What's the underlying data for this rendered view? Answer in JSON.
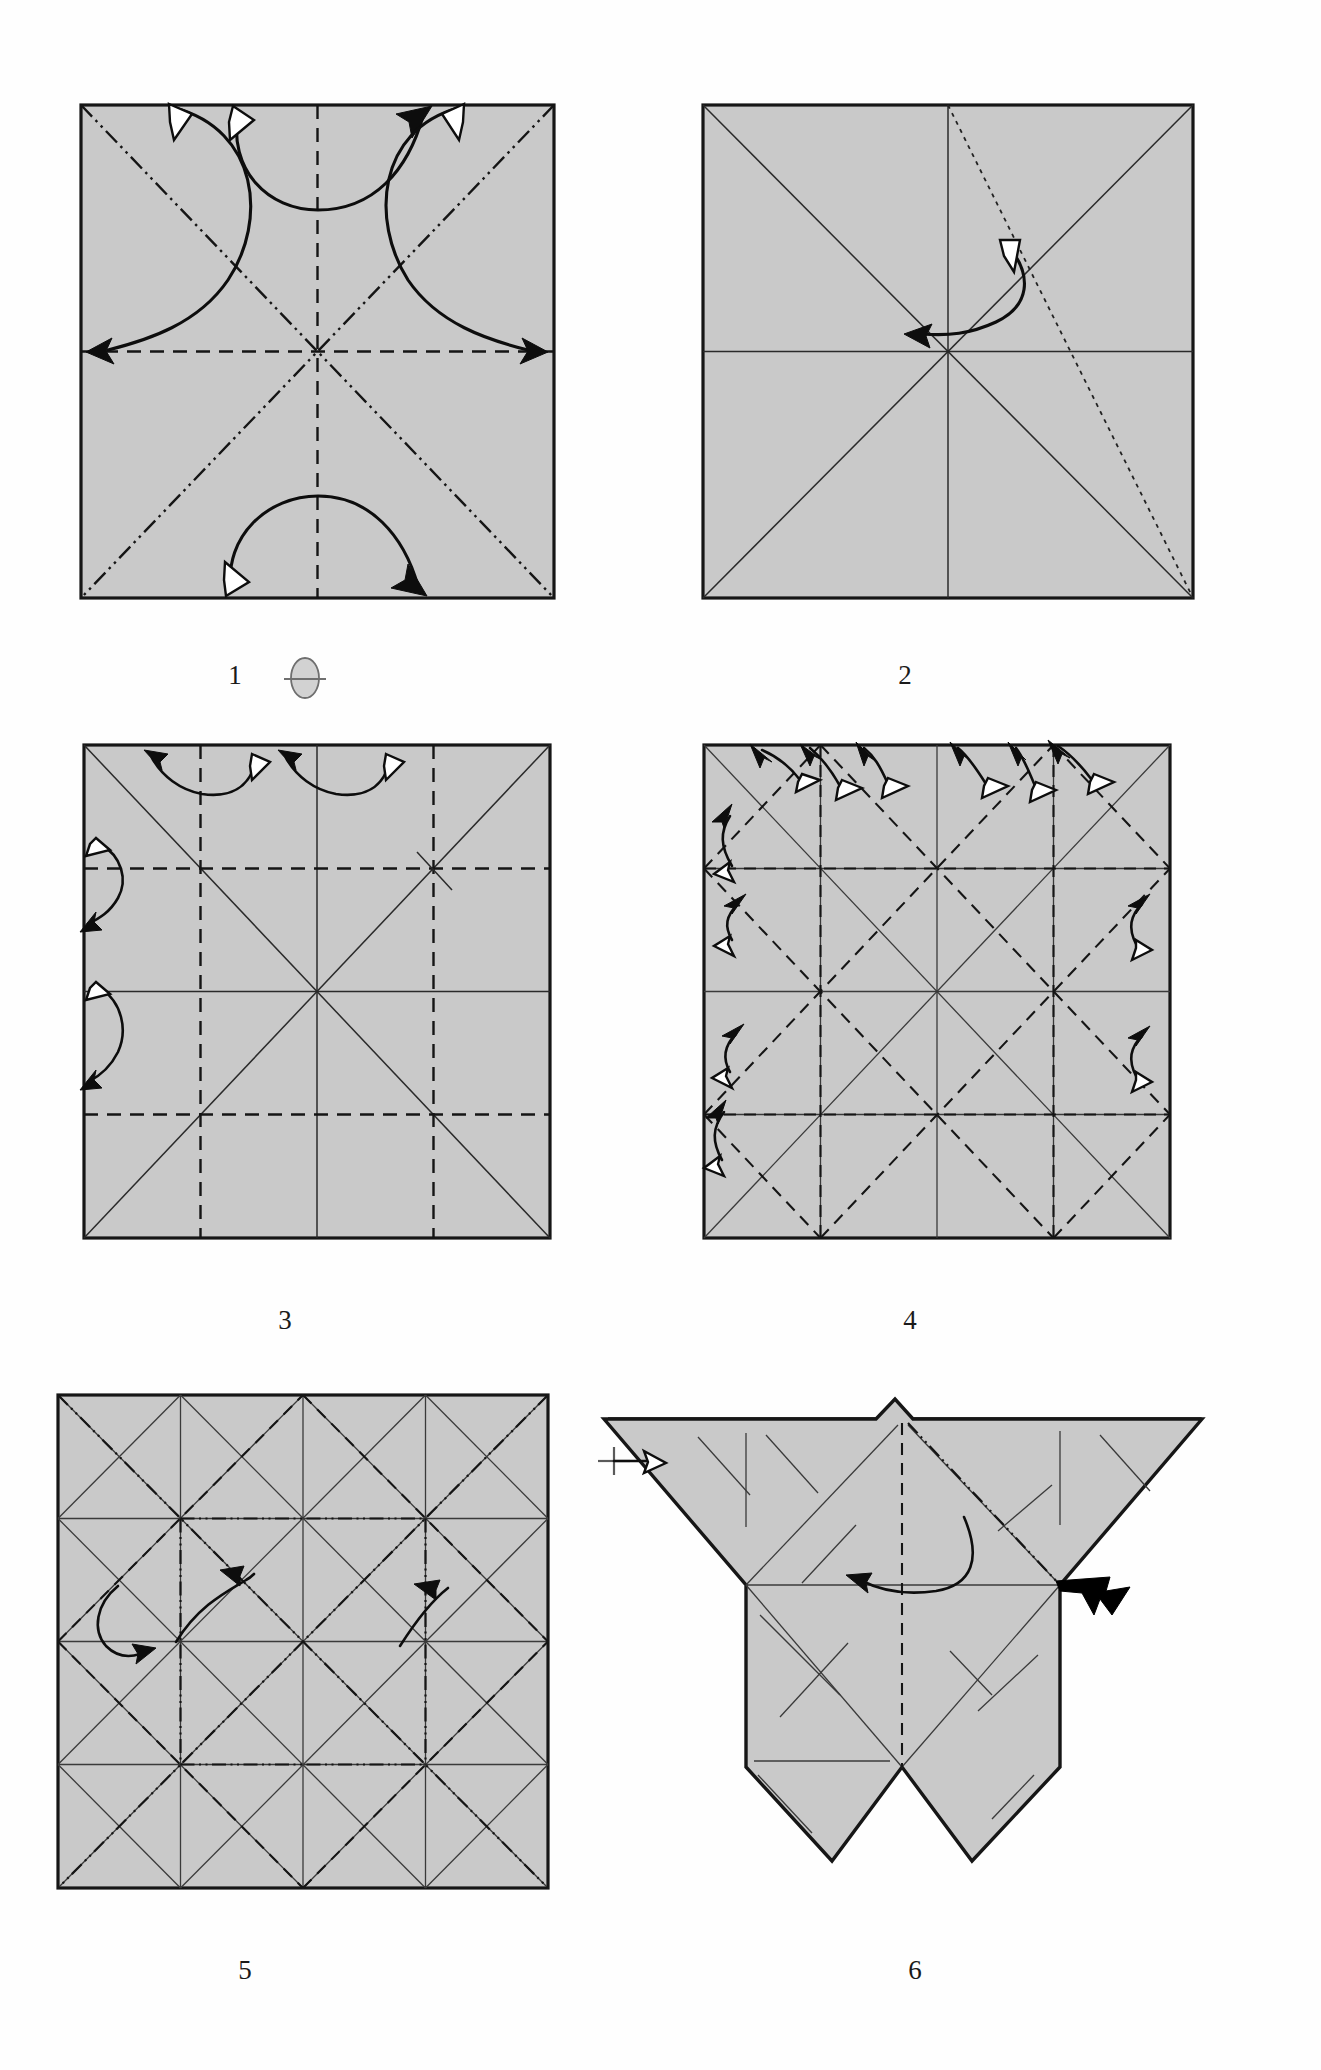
{
  "document": {
    "kind": "origami-folding-diagram",
    "background_color": "#ffffff",
    "paper_color": "#c9c9c9",
    "line_color": "#151515",
    "page_width": 1321,
    "page_height": 2070
  },
  "steps": [
    {
      "number": "1",
      "caption": "1",
      "shape": "square",
      "symbols": [
        "turn-over-symbol"
      ],
      "creases": [
        {
          "type": "mountain",
          "name": "diagonal-tl-br"
        },
        {
          "type": "mountain",
          "name": "diagonal-tr-bl"
        },
        {
          "type": "valley",
          "name": "vertical-midline"
        },
        {
          "type": "valley",
          "name": "horizontal-midline"
        }
      ],
      "arrows": [
        {
          "name": "fold-unfold-top-left",
          "style": "double-headed"
        },
        {
          "name": "fold-unfold-top-center",
          "style": "double-headed"
        },
        {
          "name": "fold-unfold-top-right",
          "style": "double-headed"
        },
        {
          "name": "fold-unfold-bottom-center",
          "style": "double-headed"
        }
      ]
    },
    {
      "number": "2",
      "caption": "2",
      "shape": "square",
      "creases": [
        {
          "type": "solid",
          "name": "diagonal-tl-br"
        },
        {
          "type": "solid",
          "name": "diagonal-tr-bl"
        },
        {
          "type": "solid",
          "name": "vertical-midline"
        },
        {
          "type": "solid",
          "name": "horizontal-midline"
        },
        {
          "type": "dotted",
          "name": "top-center-to-bottom-right"
        }
      ],
      "arrows": [
        {
          "name": "fold-unfold-diagonal",
          "style": "double-headed"
        }
      ]
    },
    {
      "number": "3",
      "caption": "3",
      "shape": "square",
      "creases": [
        {
          "type": "solid",
          "name": "diagonal-tl-br"
        },
        {
          "type": "solid",
          "name": "diagonal-tr-bl"
        },
        {
          "type": "solid",
          "name": "vertical-midline"
        },
        {
          "type": "solid",
          "name": "horizontal-midline"
        },
        {
          "type": "valley",
          "name": "vertical-quarter-left"
        },
        {
          "type": "valley",
          "name": "vertical-quarter-right"
        },
        {
          "type": "valley",
          "name": "horizontal-quarter-top"
        },
        {
          "type": "valley",
          "name": "horizontal-quarter-bottom"
        }
      ],
      "arrows": [
        {
          "name": "fold-unfold-top-left",
          "style": "double-headed"
        },
        {
          "name": "fold-unfold-top-right",
          "style": "double-headed"
        },
        {
          "name": "fold-unfold-left-upper",
          "style": "double-headed"
        },
        {
          "name": "fold-unfold-left-lower",
          "style": "double-headed"
        }
      ]
    },
    {
      "number": "4",
      "caption": "4",
      "shape": "square",
      "creases": [
        {
          "type": "solid",
          "name": "quarter-grid"
        },
        {
          "type": "solid",
          "name": "main-diagonals"
        },
        {
          "type": "valley",
          "name": "quarter-midlines"
        },
        {
          "type": "valley",
          "name": "diamond-lattice-diagonals"
        }
      ],
      "arrows": [
        {
          "name": "fold-unfold-top-1",
          "style": "double-headed"
        },
        {
          "name": "fold-unfold-top-2",
          "style": "double-headed"
        },
        {
          "name": "fold-unfold-top-3",
          "style": "double-headed"
        },
        {
          "name": "fold-unfold-top-4",
          "style": "double-headed"
        },
        {
          "name": "fold-unfold-top-5",
          "style": "double-headed"
        },
        {
          "name": "fold-unfold-top-6",
          "style": "double-headed"
        },
        {
          "name": "fold-unfold-left-1",
          "style": "double-headed"
        },
        {
          "name": "fold-unfold-left-2",
          "style": "double-headed"
        },
        {
          "name": "fold-unfold-left-3",
          "style": "double-headed"
        },
        {
          "name": "fold-unfold-left-4",
          "style": "double-headed"
        },
        {
          "name": "fold-unfold-right-1",
          "style": "double-headed"
        },
        {
          "name": "fold-unfold-right-2",
          "style": "double-headed"
        }
      ]
    },
    {
      "number": "5",
      "caption": "5",
      "shape": "square",
      "creases": [
        {
          "type": "solid",
          "name": "quarter-grid"
        },
        {
          "type": "solid",
          "name": "diamond-lattice"
        },
        {
          "type": "mountain",
          "name": "main-diagonals"
        },
        {
          "type": "mountain",
          "name": "inner-square"
        },
        {
          "type": "valley",
          "name": "inner-diagonals"
        }
      ],
      "arrows": [
        {
          "name": "fold-arrow-left",
          "style": "single-headed"
        },
        {
          "name": "fold-arrow-center",
          "style": "single-headed"
        },
        {
          "name": "fold-arrow-right",
          "style": "single-headed"
        }
      ]
    },
    {
      "number": "6",
      "caption": "6",
      "shape": "butterfly-base",
      "creases": [
        {
          "type": "solid",
          "name": "surface-creases"
        },
        {
          "type": "valley",
          "name": "vertical-centerline"
        },
        {
          "type": "mountain",
          "name": "upper-right-diagonal"
        }
      ],
      "arrows": [
        {
          "name": "fold-arrow-center",
          "style": "single-headed"
        },
        {
          "name": "push-in-arrow-right",
          "style": "solid-black"
        },
        {
          "name": "reference-marker-left",
          "style": "hollow-head"
        }
      ],
      "markers": [
        "crosshair-reference-mark"
      ]
    }
  ]
}
